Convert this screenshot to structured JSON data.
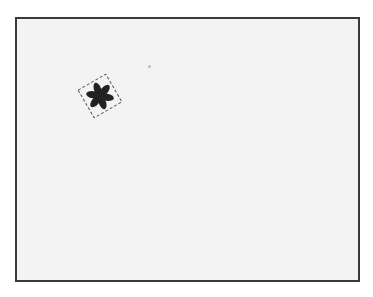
{
  "canvas": {
    "background": "#f3f3f3",
    "border_color": "#3a3a3a"
  },
  "sprite": {
    "icon": "flower-icon",
    "petals": 6,
    "color": "#222222",
    "selected": true,
    "rotation_deg": -30
  },
  "marker": {
    "icon": "dot-icon"
  }
}
